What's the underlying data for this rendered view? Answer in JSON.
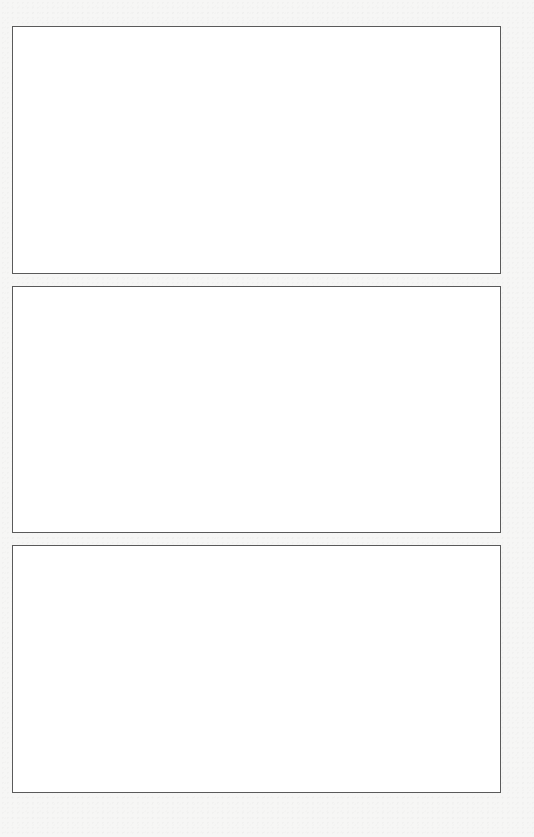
{
  "page": {
    "background_color": "#f6f6f5",
    "panel_border_color": "#5a5a5a",
    "panel_fill_color": "#ffffff"
  },
  "panels": [
    {
      "id": "panel-1",
      "content": ""
    },
    {
      "id": "panel-2",
      "content": ""
    },
    {
      "id": "panel-3",
      "content": ""
    }
  ]
}
